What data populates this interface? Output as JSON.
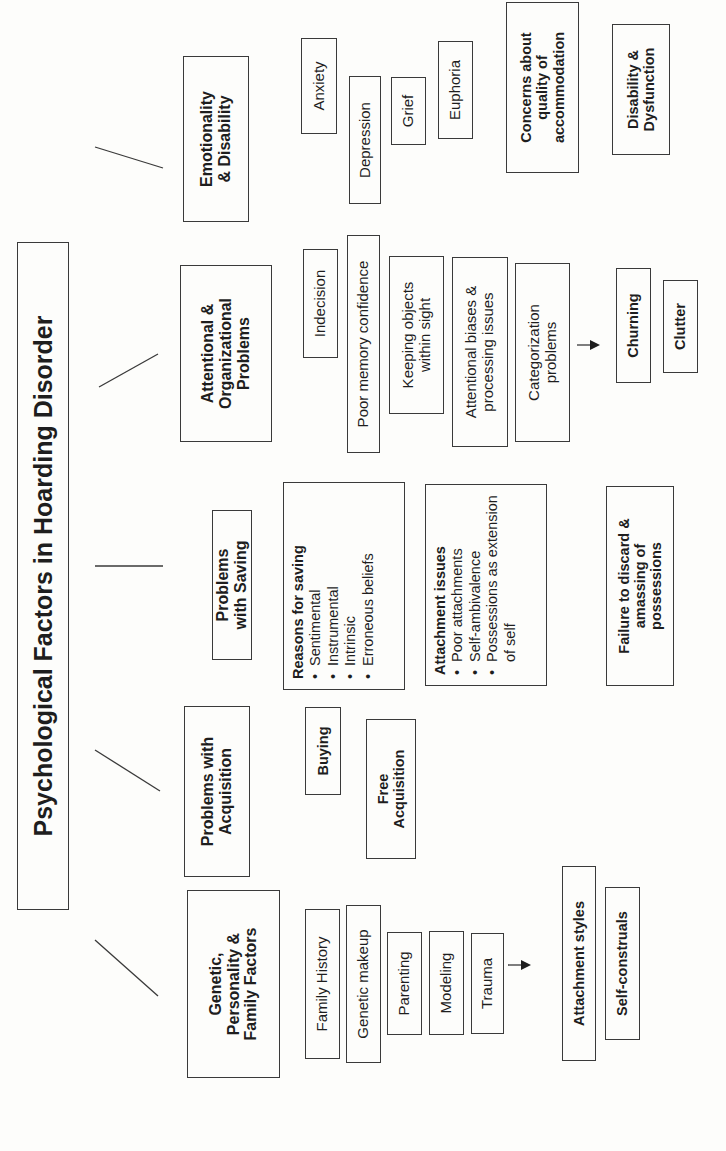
{
  "title": "Psychological Factors in Hoarding Disorder",
  "categories": {
    "genetic": {
      "label_lines": [
        "Genetic,",
        "Personality &",
        "Family Factors"
      ],
      "items": [
        "Family History",
        "Genetic makeup",
        "Parenting",
        "Modeling",
        "Trauma"
      ],
      "outcomes": [
        "Attachment styles",
        "Self-construals"
      ]
    },
    "acquisition": {
      "label_lines": [
        "Problems with",
        "Acquisition"
      ],
      "items": [
        "Buying",
        "Free Acquisition"
      ]
    },
    "saving": {
      "label_lines": [
        "Problems",
        "with Saving"
      ],
      "reasons": {
        "heading": "Reasons for saving",
        "items": [
          "Sentimental",
          "Instrumental",
          "Intrinsic",
          "Erroneous beliefs"
        ]
      },
      "attachment": {
        "heading": "Attachment issues",
        "items": [
          "Poor attachments",
          "Self-ambivalence",
          "Possessions as extension of self"
        ]
      },
      "outcome": "Failure to discard & amassing of possessions"
    },
    "attentional": {
      "label_lines": [
        "Attentional &",
        "Organizational",
        "Problems"
      ],
      "items": [
        "Indecision",
        "Poor memory confidence",
        "Keeping objects within sight",
        "Attentional biases & processing issues",
        "Categorization problems"
      ],
      "outcomes": [
        "Churning",
        "Clutter"
      ]
    },
    "emotionality": {
      "label_lines": [
        "Emotionality",
        "& Disability"
      ],
      "items": [
        "Anxiety",
        "Depression",
        "Grief",
        "Euphoria"
      ],
      "outcomes": [
        "Concerns about quality of accommodation",
        "Disability & Dysfunction"
      ]
    }
  },
  "icons": {
    "arrow": "right-arrow-icon"
  },
  "colors": {
    "line": "#3a3a3a",
    "background": "#fdfdfb",
    "text": "#1e1e1e"
  }
}
